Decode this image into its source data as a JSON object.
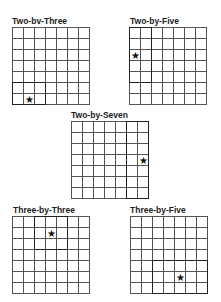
{
  "grid_size": {
    "rows": 7,
    "cols": 7
  },
  "star_glyph": "★",
  "panels": [
    {
      "id": "two-by-three",
      "label": "Two-bv-Three",
      "x": 12,
      "y": 27,
      "label_dx": 0,
      "box": {
        "col": 0,
        "row": 5,
        "w": 3,
        "h": 2
      },
      "star": {
        "col": 1,
        "row": 6
      }
    },
    {
      "id": "two-by-five",
      "label": "Two-by-Five",
      "x": 129,
      "y": 27,
      "label_dx": 1,
      "box": {
        "col": 0,
        "row": 0,
        "w": 2,
        "h": 5
      },
      "star": {
        "col": 0,
        "row": 2
      }
    },
    {
      "id": "two-by-seven",
      "label": "Two-by-Seven",
      "x": 71,
      "y": 121,
      "label_dx": 0,
      "box": {
        "col": 5,
        "row": 0,
        "w": 2,
        "h": 7
      },
      "star": {
        "col": 6,
        "row": 3
      }
    },
    {
      "id": "three-by-three",
      "label": "Three-by-Three",
      "x": 12,
      "y": 216,
      "label_dx": 1,
      "box": {
        "col": 2,
        "row": 0,
        "w": 3,
        "h": 3
      },
      "star": {
        "col": 3,
        "row": 1
      }
    },
    {
      "id": "three-by-five",
      "label": "Three-by-Five",
      "x": 130,
      "y": 216,
      "label_dx": 0,
      "box": {
        "col": 2,
        "row": 4,
        "w": 5,
        "h": 3
      },
      "star": {
        "col": 4,
        "row": 5
      }
    }
  ]
}
